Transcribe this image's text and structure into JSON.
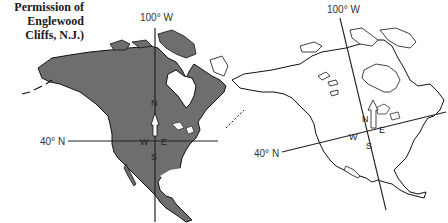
{
  "caption": {
    "lines": [
      "Permission of",
      "Englewood",
      "Cliffs, N.J.)"
    ]
  },
  "left_map": {
    "meridian_label": "100° W",
    "parallel_label": "40° N",
    "compass": {
      "north": "N",
      "south": "S",
      "east": "E",
      "west": "W"
    },
    "fill_color": "#6e6e6e",
    "arrow_icon": "north-arrow-icon"
  },
  "right_map": {
    "meridian_label": "100° W",
    "parallel_label": "40° N",
    "compass": {
      "north": "N",
      "south": "S",
      "east": "E",
      "west": "W"
    },
    "fill_color": "#ffffff",
    "arrow_icon": "north-arrow-icon"
  }
}
